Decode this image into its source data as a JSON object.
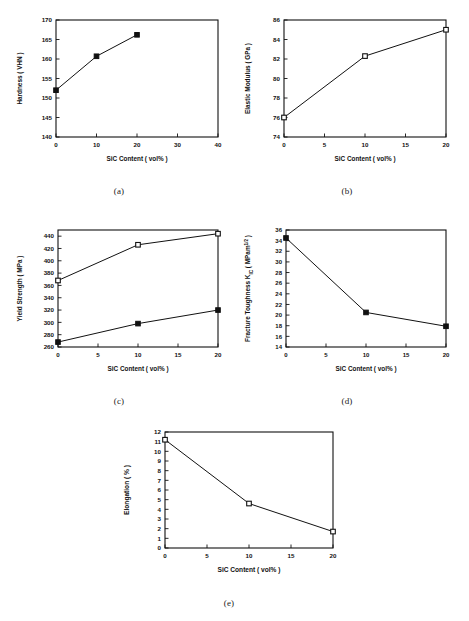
{
  "figure": {
    "shared_xlabel": "SiC Content ( vol% )",
    "captions": {
      "a": "(a)",
      "b": "(b)",
      "c": "(c)",
      "d": "(d)",
      "e": "(e)"
    }
  },
  "chart_data": [
    {
      "id": "a",
      "type": "line",
      "title": "",
      "xlabel": "SiC Content ( vol% )",
      "ylabel": "Hardness ( VHN )",
      "xlim": [
        0,
        40
      ],
      "ylim": [
        140,
        170
      ],
      "xticks": [
        0,
        10,
        20,
        30,
        40
      ],
      "yticks": [
        140,
        145,
        150,
        155,
        160,
        165,
        170
      ],
      "grid": false,
      "legend": "none",
      "marker": "filled-square",
      "x": [
        0,
        10,
        20
      ],
      "values": [
        152.0,
        160.7,
        166.2
      ]
    },
    {
      "id": "b",
      "type": "line",
      "title": "",
      "xlabel": "SiC Content ( vol% )",
      "ylabel": "Elastic Modulus ( GPa )",
      "xlim": [
        0,
        20
      ],
      "ylim": [
        74,
        86
      ],
      "xticks": [
        0,
        5,
        10,
        15,
        20
      ],
      "yticks": [
        74,
        76,
        78,
        80,
        82,
        84,
        86
      ],
      "grid": false,
      "legend": "none",
      "marker": "open-square",
      "x": [
        0,
        10,
        20
      ],
      "values": [
        76.0,
        82.3,
        85.0
      ]
    },
    {
      "id": "c",
      "type": "line",
      "title": "",
      "xlabel": "SiC Content ( vol% )",
      "ylabel": "Yield Strength ( MPa )",
      "xlim": [
        0,
        20
      ],
      "ylim": [
        260,
        450
      ],
      "xticks": [
        0,
        5,
        10,
        15,
        20
      ],
      "yticks": [
        260,
        280,
        300,
        320,
        340,
        360,
        380,
        400,
        420,
        440
      ],
      "grid": false,
      "legend": "none",
      "x": [
        0,
        10,
        20
      ],
      "series": [
        {
          "name": "upper",
          "marker": "open-square",
          "values": [
            368,
            426,
            444
          ]
        },
        {
          "name": "lower",
          "marker": "filled-square",
          "values": [
            268,
            298,
            320
          ]
        }
      ]
    },
    {
      "id": "d",
      "type": "line",
      "title": "",
      "xlabel": "SiC Content ( vol% )",
      "ylabel": "Fracture Toughness K",
      "ylabel_sub": "IC",
      "ylabel_rest": " ( MPam",
      "ylabel_sup": "1/2",
      "ylabel_tail": " )",
      "xlim": [
        0,
        20
      ],
      "ylim": [
        14,
        36
      ],
      "xticks": [
        0,
        5,
        10,
        15,
        20
      ],
      "yticks": [
        14,
        16,
        18,
        20,
        22,
        24,
        26,
        28,
        30,
        32,
        34,
        36
      ],
      "grid": false,
      "legend": "none",
      "marker": "filled-square",
      "x": [
        0,
        10,
        20
      ],
      "values": [
        34.5,
        20.5,
        17.9
      ]
    },
    {
      "id": "e",
      "type": "line",
      "title": "",
      "xlabel": "SiC Content ( vol% )",
      "ylabel": "Elongation ( % )",
      "xlim": [
        0,
        20
      ],
      "ylim": [
        0,
        12
      ],
      "xticks": [
        0,
        5,
        10,
        15,
        20
      ],
      "yticks": [
        0,
        1,
        2,
        3,
        4,
        5,
        6,
        7,
        8,
        9,
        10,
        11,
        12
      ],
      "grid": false,
      "legend": "none",
      "marker": "open-square",
      "x": [
        0,
        10,
        20
      ],
      "values": [
        11.2,
        4.6,
        1.7
      ]
    }
  ]
}
